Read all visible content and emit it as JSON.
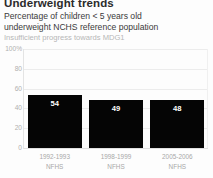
{
  "header": {
    "title": "Underweight trends",
    "subtitle_line1": "Percentage of children < 5 years old",
    "subtitle_line2": "underweight NCHS reference population",
    "note": "Insufficient progress towards MDG1"
  },
  "colors": {
    "bar": "#050505",
    "gridline": "#ececec",
    "tick_text": "#b0b0b0",
    "note_text": "#b7b7b7",
    "value_text": "#ffffff",
    "background": "#fdfdfd"
  },
  "chart_data": {
    "type": "bar",
    "title": "Underweight trends",
    "subtitle": "Percentage of children < 5 years old underweight NCHS reference population",
    "annotations": [
      "Insufficient progress towards MDG1"
    ],
    "categories": [
      "1992-1993 NFHS",
      "1998-1999 NFHS",
      "2005-2006 NFHS"
    ],
    "category_lines": [
      {
        "line1": "1992-1993",
        "line2": "NFHS"
      },
      {
        "line1": "1998-1999",
        "line2": "NFHS"
      },
      {
        "line1": "2005-2006",
        "line2": "NFHS"
      }
    ],
    "values": [
      54,
      49,
      48
    ],
    "xlabel": "",
    "ylabel": "",
    "ylim": [
      0,
      100
    ],
    "yticks": [
      100,
      80,
      60,
      40,
      20,
      0
    ],
    "ytick_labels": [
      "100%",
      "80",
      "60",
      "40",
      "20",
      "0"
    ],
    "grid": true,
    "legend": false
  }
}
